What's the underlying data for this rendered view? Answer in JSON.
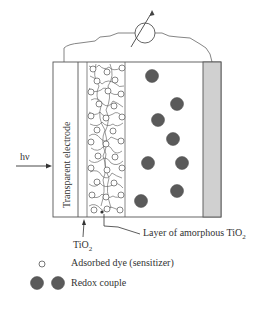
{
  "diagram": {
    "labels": {
      "transparent_electrode": "Transparent electrode",
      "light_input": "hν",
      "tio2": "TiO",
      "tio2_sub": "2",
      "amorphous_layer": "Layer of amorphous TiO",
      "amorphous_layer_sub": "2"
    },
    "legend": [
      {
        "symbol": "open-circle",
        "label": "Adsorbed dye (sensitizer)"
      },
      {
        "symbol": "filled-circle-pair",
        "label": "Redox couple"
      }
    ],
    "components": [
      "transparent electrode",
      "TiO2 layer",
      "porous TiO2 with dye",
      "electrolyte with redox couple",
      "counter electrode",
      "external circuit with meter"
    ],
    "colors": {
      "line": "#555555",
      "redox": "#5a5a5a",
      "counter_electrode": "#d0d0d0"
    }
  }
}
